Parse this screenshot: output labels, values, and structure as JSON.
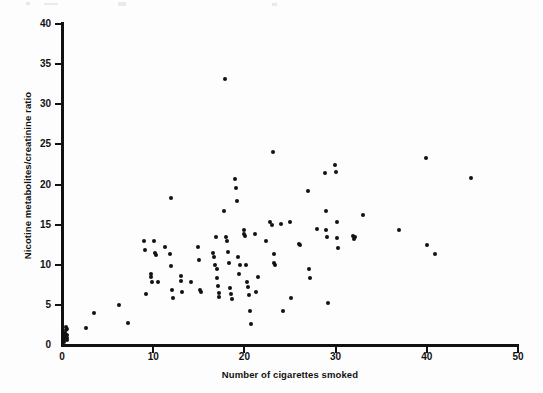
{
  "figure": {
    "background_color": "#fdfdfd",
    "ink_color": "#111111"
  },
  "chart_data": {
    "type": "scatter",
    "title": "",
    "xlabel": "Number of cigarettes smoked",
    "ylabel": "Nicotine metabolites/creatinine ratio",
    "xlim": [
      0,
      50
    ],
    "ylim": [
      0,
      40
    ],
    "xticks": [
      0,
      10,
      20,
      30,
      40,
      50
    ],
    "yticks": [
      0,
      5,
      10,
      15,
      20,
      25,
      30,
      35,
      40
    ],
    "xticklabels": [
      "0",
      "10",
      "20",
      "30",
      "40",
      "50"
    ],
    "yticklabels": [
      "0",
      "5",
      "10",
      "15",
      "20",
      "25",
      "30",
      "35",
      "40"
    ],
    "grid": false,
    "legend": null,
    "marker": "filled-circle",
    "marker_color": "#111111",
    "n_points": 129,
    "points": [
      [
        0.2,
        0.4
      ],
      [
        0.2,
        0.8
      ],
      [
        0.3,
        1.1
      ],
      [
        0.3,
        1.5
      ],
      [
        0.4,
        1.9
      ],
      [
        0.4,
        2.3
      ],
      [
        0.5,
        0.6
      ],
      [
        0.5,
        1.3
      ],
      [
        0.6,
        2.0
      ],
      [
        0.6,
        0.9
      ],
      [
        2.6,
        2.1
      ],
      [
        3.5,
        4.0
      ],
      [
        6.2,
        5.0
      ],
      [
        7.2,
        2.7
      ],
      [
        9.0,
        12.9
      ],
      [
        9.1,
        11.8
      ],
      [
        9.2,
        6.4
      ],
      [
        9.8,
        8.9
      ],
      [
        9.8,
        8.5
      ],
      [
        9.9,
        7.8
      ],
      [
        10.1,
        12.9
      ],
      [
        10.2,
        11.5
      ],
      [
        10.3,
        11.2
      ],
      [
        10.5,
        7.8
      ],
      [
        11.3,
        12.2
      ],
      [
        11.8,
        11.4
      ],
      [
        11.9,
        18.3
      ],
      [
        12.0,
        9.8
      ],
      [
        12.1,
        6.8
      ],
      [
        12.2,
        5.8
      ],
      [
        13.0,
        8.6
      ],
      [
        13.1,
        8.0
      ],
      [
        13.2,
        6.6
      ],
      [
        14.1,
        7.8
      ],
      [
        14.9,
        12.2
      ],
      [
        15.0,
        10.6
      ],
      [
        15.1,
        6.9
      ],
      [
        15.2,
        6.6
      ],
      [
        16.6,
        11.5
      ],
      [
        16.7,
        11.0
      ],
      [
        16.8,
        10.0
      ],
      [
        16.9,
        13.4
      ],
      [
        17.0,
        9.5
      ],
      [
        17.0,
        8.3
      ],
      [
        17.1,
        7.3
      ],
      [
        17.2,
        6.5
      ],
      [
        17.2,
        6.0
      ],
      [
        17.8,
        16.7
      ],
      [
        17.9,
        33.1
      ],
      [
        18.0,
        13.5
      ],
      [
        18.1,
        12.9
      ],
      [
        18.2,
        11.6
      ],
      [
        18.3,
        10.2
      ],
      [
        18.4,
        7.1
      ],
      [
        18.5,
        6.4
      ],
      [
        18.6,
        5.7
      ],
      [
        19.0,
        20.7
      ],
      [
        19.1,
        19.6
      ],
      [
        19.2,
        18.0
      ],
      [
        19.3,
        11.0
      ],
      [
        19.4,
        8.8
      ],
      [
        19.5,
        10.0
      ],
      [
        20.0,
        14.3
      ],
      [
        20.0,
        13.8
      ],
      [
        20.1,
        13.6
      ],
      [
        20.2,
        10.0
      ],
      [
        20.3,
        7.8
      ],
      [
        20.4,
        7.2
      ],
      [
        20.5,
        6.2
      ],
      [
        20.6,
        4.2
      ],
      [
        20.7,
        2.6
      ],
      [
        21.2,
        13.8
      ],
      [
        21.3,
        6.6
      ],
      [
        21.5,
        8.5
      ],
      [
        22.4,
        12.9
      ],
      [
        22.8,
        15.3
      ],
      [
        23.0,
        15.0
      ],
      [
        23.1,
        24.0
      ],
      [
        23.2,
        11.3
      ],
      [
        23.3,
        10.2
      ],
      [
        23.4,
        10.0
      ],
      [
        24.0,
        15.1
      ],
      [
        24.2,
        4.2
      ],
      [
        25.0,
        15.3
      ],
      [
        25.1,
        5.9
      ],
      [
        26.0,
        12.6
      ],
      [
        26.1,
        12.5
      ],
      [
        27.0,
        19.2
      ],
      [
        27.1,
        9.5
      ],
      [
        27.2,
        8.3
      ],
      [
        28.0,
        14.5
      ],
      [
        28.8,
        21.4
      ],
      [
        28.9,
        16.7
      ],
      [
        29.0,
        14.3
      ],
      [
        29.1,
        13.4
      ],
      [
        29.2,
        5.2
      ],
      [
        29.9,
        22.4
      ],
      [
        30.0,
        21.6
      ],
      [
        30.1,
        15.3
      ],
      [
        30.2,
        13.3
      ],
      [
        30.3,
        12.1
      ],
      [
        31.9,
        13.6
      ],
      [
        32.0,
        13.2
      ],
      [
        32.1,
        13.4
      ],
      [
        33.0,
        16.2
      ],
      [
        37.0,
        14.3
      ],
      [
        39.9,
        23.3
      ],
      [
        40.0,
        12.5
      ],
      [
        40.9,
        11.3
      ],
      [
        44.9,
        20.8
      ]
    ]
  },
  "axes": {
    "y_title": "Nicotine metabolites/creatinine ratio",
    "x_title": "Number of cigarettes smoked"
  }
}
